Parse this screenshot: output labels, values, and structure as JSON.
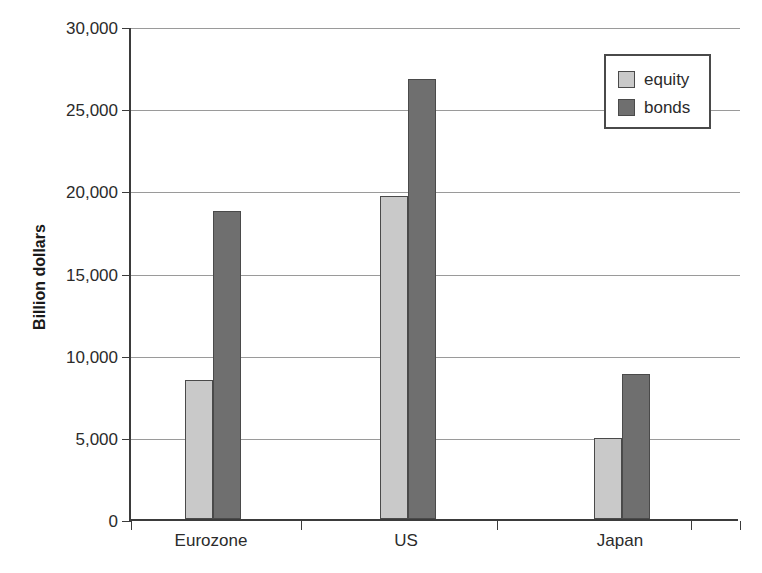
{
  "chart_data": {
    "type": "bar",
    "title": "",
    "xlabel": "",
    "ylabel": "Billion dollars",
    "categories": [
      "Eurozone",
      "US",
      "Japan"
    ],
    "series": [
      {
        "name": "equity",
        "color": "#c9c9c9",
        "values": [
          8450,
          19650,
          4900
        ]
      },
      {
        "name": "bonds",
        "color": "#6f6f6f",
        "values": [
          18750,
          26800,
          8800
        ]
      }
    ],
    "ylim": [
      0,
      30000
    ],
    "ytick_values": [
      0,
      5000,
      10000,
      15000,
      20000,
      25000,
      30000
    ],
    "ytick_labels": [
      "0",
      "5,000",
      "10,000",
      "15,000",
      "20,000",
      "25,000",
      "30,000"
    ],
    "grid": true,
    "legend_position": "top-right"
  },
  "axis": {
    "y_title": "Billion dollars",
    "ticks": [
      {
        "label": "30,000",
        "value": 30000
      },
      {
        "label": "25,000",
        "value": 25000
      },
      {
        "label": "20,000",
        "value": 20000
      },
      {
        "label": "15,000",
        "value": 15000
      },
      {
        "label": "10,000",
        "value": 10000
      },
      {
        "label": "5,000",
        "value": 5000
      },
      {
        "label": "0",
        "value": 0
      }
    ]
  },
  "categories": [
    {
      "label": "Eurozone"
    },
    {
      "label": "US"
    },
    {
      "label": "Japan"
    }
  ],
  "legend": {
    "items": [
      {
        "label": "equity",
        "color": "#c9c9c9"
      },
      {
        "label": "bonds",
        "color": "#6f6f6f"
      }
    ]
  },
  "colors": {
    "equity": "#c9c9c9",
    "bonds": "#6f6f6f",
    "axis": "#3b3b3b",
    "grid": "#9a9a9a",
    "text": "#2b2b2b",
    "background": "#ffffff"
  }
}
